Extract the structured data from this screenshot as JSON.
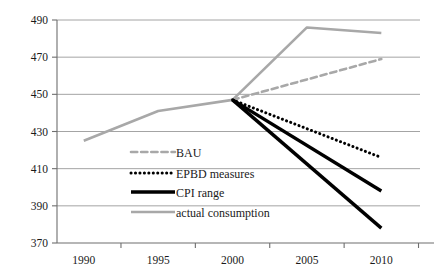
{
  "chart_data": {
    "type": "line",
    "title": "",
    "xlabel": "",
    "ylabel": "",
    "x": [
      1990,
      1995,
      2000,
      2005,
      2010
    ],
    "xtick_labels": [
      "1990",
      "1995",
      "2000",
      "2005",
      "2010"
    ],
    "ytick_labels": [
      "370",
      "390",
      "410",
      "430",
      "450",
      "470",
      "490"
    ],
    "ytick_values": [
      370,
      390,
      410,
      430,
      450,
      470,
      490
    ],
    "ylim": [
      370,
      490
    ],
    "xlim": [
      1988.2,
      2012.6
    ],
    "grid": "horizontal",
    "legend_position": "inside-lower-left",
    "series": [
      {
        "name": "BAU",
        "style": "dashed",
        "color": "#a8a8a8",
        "width": 2.6,
        "x": [
          2000,
          2010
        ],
        "values": [
          447,
          469
        ]
      },
      {
        "name": "EPBD measures",
        "style": "dotted",
        "color": "#000000",
        "width": 3.0,
        "x": [
          2000,
          2010
        ],
        "values": [
          447,
          416
        ]
      },
      {
        "name": "CPI range",
        "style": "solid",
        "color": "#000000",
        "width": 3.4,
        "x": [
          2000,
          2010
        ],
        "values": [
          447,
          398
        ],
        "band_lower": [
          447,
          378
        ]
      },
      {
        "name": "actual consumption",
        "style": "solid",
        "color": "#a8a8a8",
        "width": 2.6,
        "x": [
          1990,
          1995,
          2000,
          2005,
          2010
        ],
        "values": [
          425,
          441,
          447,
          486,
          483
        ]
      }
    ]
  },
  "legend": {
    "items": [
      {
        "label": "BAU",
        "swatch": "dashed-gray"
      },
      {
        "label": "EPBD measures",
        "swatch": "dotted-black"
      },
      {
        "label": "CPI range",
        "swatch": "solid-black-thick"
      },
      {
        "label": "actual consumption",
        "swatch": "solid-gray"
      }
    ]
  },
  "colors": {
    "gray_series": "#a8a8a8",
    "black_series": "#000000",
    "gridline": "#9a9a9a",
    "axis": "#6e6e6e",
    "text": "#1a1a1a"
  }
}
